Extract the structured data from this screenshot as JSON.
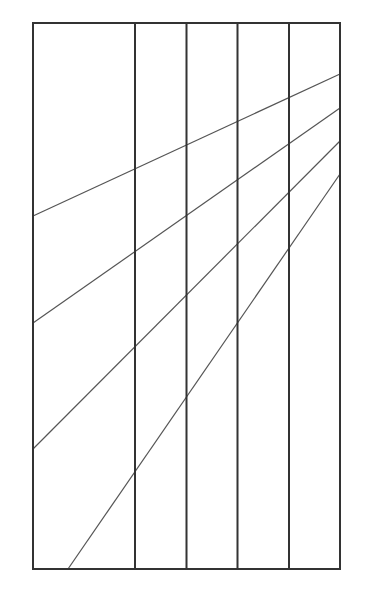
{
  "canvas": {
    "width": 366,
    "height": 597,
    "background": "#ffffff"
  },
  "colors": {
    "frame": "#333333",
    "diagonal": "#555555"
  },
  "frame": {
    "x1": 33,
    "y1": 23,
    "x2": 340,
    "y2": 569
  },
  "vertical_dividers": [
    135,
    186.5,
    237.5,
    289
  ],
  "diagonals": [
    {
      "x1": 33,
      "y1": 216,
      "x2": 340,
      "y2": 74
    },
    {
      "x1": 33,
      "y1": 323,
      "x2": 340,
      "y2": 108
    },
    {
      "x1": 33,
      "y1": 449,
      "x2": 340,
      "y2": 141
    },
    {
      "x1": 68,
      "y1": 569,
      "x2": 340,
      "y2": 174
    }
  ]
}
